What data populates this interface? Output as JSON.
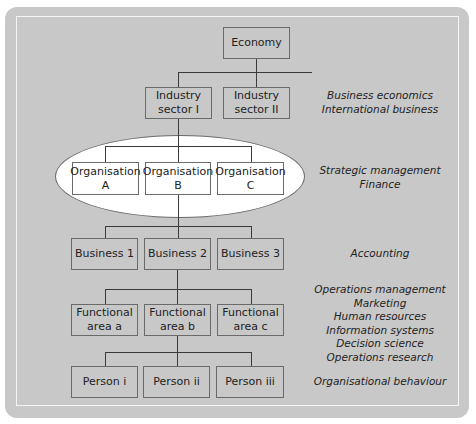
{
  "diagram": {
    "title": "",
    "levels": [
      {
        "id": "economy",
        "nodes": [
          "Economy"
        ],
        "disciplines": []
      },
      {
        "id": "industry",
        "nodes": [
          "Industry\nsector I",
          "Industry\nsector II"
        ],
        "disciplines": [
          "Business economics",
          "International business"
        ]
      },
      {
        "id": "organisation",
        "nodes": [
          "Organisation\nA",
          "Organisation\nB",
          "Organisation\nC"
        ],
        "highlighted": true,
        "disciplines": [
          "Strategic management",
          "Finance"
        ]
      },
      {
        "id": "business",
        "nodes": [
          "Business 1",
          "Business 2",
          "Business 3"
        ],
        "disciplines": [
          "Accounting"
        ]
      },
      {
        "id": "functional",
        "nodes": [
          "Functional\narea a",
          "Functional\narea b",
          "Functional\narea c"
        ],
        "disciplines": [
          "Operations management",
          "Marketing",
          "Human resources",
          "Information systems",
          "Decision science",
          "Operations research"
        ]
      },
      {
        "id": "person",
        "nodes": [
          "Person i",
          "Person ii",
          "Person iii"
        ],
        "disciplines": [
          "Organisational behaviour"
        ]
      }
    ],
    "labels": {
      "industry": "Business economics\nInternational business",
      "organisation": "Strategic management\nFinance",
      "business": "Accounting",
      "functional": "Operations management\nMarketing\nHuman resources\nInformation systems\nDecision science\nOperations research",
      "person": "Organisational behaviour"
    },
    "colors": {
      "panel": "#c8c8c8",
      "border": "#6a6a6a",
      "highlight": "#ffffff",
      "text": "#222222"
    }
  }
}
